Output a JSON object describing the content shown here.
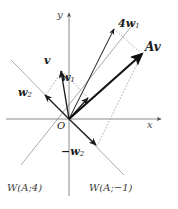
{
  "figure": {
    "name": "eigenvector-decomposition-diagram",
    "background": "#ffffff",
    "width": 178,
    "height": 209,
    "ink": "#1a1a1a",
    "light_ink": "#8a8a8a",
    "dotted_ink": "#9a9a9a"
  },
  "axes": {
    "x_label": "x",
    "y_label": "y",
    "origin_label": "O",
    "origin_px": {
      "x": 69,
      "y": 119
    }
  },
  "eigenspaces": [
    {
      "label_prefix": "W(A;",
      "label": "W(A;4)",
      "eigenvalue": "4",
      "label_px": {
        "x": 8,
        "y": 184
      },
      "direction_deg": 48
    },
    {
      "label_prefix": "W(A;",
      "label": "W(A;−1)",
      "eigenvalue": "−1",
      "label_px": {
        "x": 90,
        "y": 184
      },
      "direction_deg": 132
    }
  ],
  "vectors": [
    {
      "id": "w1",
      "label": "w",
      "subscript": "1",
      "full_label": "w₁",
      "label_px": {
        "x": 62,
        "y": 73
      },
      "tip_px": {
        "x": 89,
        "y": 96
      },
      "weight": "normal",
      "color": "#1a1a1a"
    },
    {
      "id": "w2",
      "label": "w",
      "subscript": "2",
      "full_label": "w₂",
      "label_px": {
        "x": 19,
        "y": 88
      },
      "tip_px": {
        "x": 43,
        "y": 93
      },
      "weight": "normal",
      "color": "#1a1a1a"
    },
    {
      "id": "v",
      "label": "v",
      "subscript": "",
      "full_label": "v",
      "label_px": {
        "x": 44,
        "y": 57
      },
      "tip_px": {
        "x": 60,
        "y": 72
      },
      "weight": "normal",
      "color": "#1a1a1a"
    },
    {
      "id": "neg-w2",
      "label": "−w",
      "subscript": "2",
      "full_label": "−w₂",
      "label_px": {
        "x": 62,
        "y": 147
      },
      "tip_px": {
        "x": 96,
        "y": 145
      },
      "weight": "normal",
      "color": "#1a1a1a"
    },
    {
      "id": "4w1",
      "label": "4w",
      "subscript": "1",
      "full_label": "4w₁",
      "label_px": {
        "x": 119,
        "y": 19
      },
      "tip_px": {
        "x": 114,
        "y": 28
      },
      "weight": "normal",
      "color": "#1a1a1a"
    },
    {
      "id": "Av",
      "label": "Av",
      "subscript": "",
      "full_label": "Av",
      "label_px": {
        "x": 146,
        "y": 43
      },
      "tip_px": {
        "x": 143,
        "y": 53
      },
      "weight": "bold",
      "color": "#111111"
    }
  ]
}
